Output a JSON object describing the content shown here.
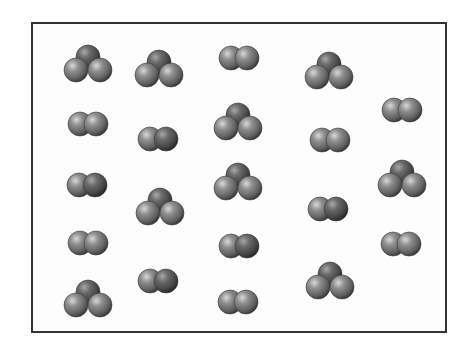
{
  "diagram": {
    "frame": {
      "x": 31,
      "y": 22,
      "width": 416,
      "height": 311,
      "border_color": "#333333"
    },
    "atom_radius": 12,
    "colors": {
      "atom_light": "#8a8a8a",
      "atom_mid": "#6e6e6e",
      "atom_dark": "#4a4a4a",
      "highlight": "#d8d8d8",
      "shadow": "#2e2e2e"
    },
    "legend_counts": {
      "triatomic": 9,
      "diatomic": 12,
      "total": 21
    },
    "molecules": [
      {
        "type": "triatomic",
        "x": 88,
        "y": 65
      },
      {
        "type": "triatomic",
        "x": 159,
        "y": 70
      },
      {
        "type": "diatomic",
        "x": 239,
        "y": 58
      },
      {
        "type": "triatomic",
        "x": 329,
        "y": 72
      },
      {
        "type": "diatomic",
        "x": 402,
        "y": 110
      },
      {
        "type": "diatomic",
        "x": 88,
        "y": 124
      },
      {
        "type": "diatomic",
        "x": 158,
        "y": 139
      },
      {
        "type": "triatomic",
        "x": 238,
        "y": 123
      },
      {
        "type": "diatomic",
        "x": 330,
        "y": 140
      },
      {
        "type": "diatomic",
        "x": 87,
        "y": 185
      },
      {
        "type": "triatomic",
        "x": 160,
        "y": 208
      },
      {
        "type": "triatomic",
        "x": 238,
        "y": 183
      },
      {
        "type": "diatomic",
        "x": 328,
        "y": 209
      },
      {
        "type": "triatomic",
        "x": 402,
        "y": 180
      },
      {
        "type": "diatomic",
        "x": 88,
        "y": 243
      },
      {
        "type": "diatomic",
        "x": 239,
        "y": 246
      },
      {
        "type": "diatomic",
        "x": 401,
        "y": 244
      },
      {
        "type": "triatomic",
        "x": 88,
        "y": 300
      },
      {
        "type": "diatomic",
        "x": 158,
        "y": 281
      },
      {
        "type": "diatomic",
        "x": 238,
        "y": 302
      },
      {
        "type": "triatomic",
        "x": 330,
        "y": 282
      }
    ]
  }
}
